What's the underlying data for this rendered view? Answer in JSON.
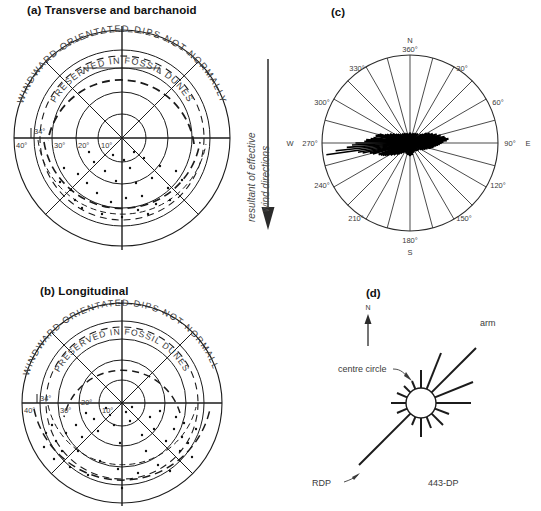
{
  "figure": {
    "panels": [
      {
        "id": "a",
        "title": "(a) Transverse and barchanoid"
      },
      {
        "id": "b",
        "title": "(b) Longitudinal"
      },
      {
        "id": "c",
        "title": "(c)"
      },
      {
        "id": "d",
        "title": "(d)"
      }
    ]
  },
  "dip_plot": {
    "outer_arc_text": "WINDWARD  ORIENTATED   DIPS   NOT   NORMALLY",
    "inner_arc_text": "PRESERVED IN    FOSSIL    DUNES",
    "arc_words_outer": [
      "WINDWARD",
      "ORIENTATED",
      "DIPS",
      "NOT",
      "NORMALLY"
    ],
    "arc_words_inner": [
      "PRESERVED IN",
      "FOSSIL",
      "DUNES"
    ],
    "ring_labels": [
      "40°",
      "30°",
      "20°",
      "10°"
    ],
    "special_label": "34°",
    "ring_values": [
      40,
      30,
      20,
      10
    ],
    "special_value": 34
  },
  "middle_arrow": {
    "line1": "resultant of effective",
    "line2": "wind directions",
    "direction": "down"
  },
  "rose": {
    "cardinals": {
      "north": "N",
      "east": "E",
      "south": "S",
      "west": "W"
    },
    "tick_labels": [
      "360°",
      "30°",
      "60°",
      "90°",
      "120°",
      "150°",
      "180°",
      "210°",
      "240°",
      "270°",
      "300°",
      "330°"
    ],
    "tick_angles": [
      0,
      30,
      60,
      90,
      120,
      150,
      180,
      210,
      240,
      270,
      300,
      330
    ],
    "sector_count": 24
  },
  "sand_rose": {
    "labels": {
      "arm": "arm",
      "centre_circle": "centre circle",
      "rdp": "RDP",
      "dp_value": "443-DP",
      "north": "N"
    }
  },
  "chart_data": [
    {
      "type": "scatter",
      "panel": "a",
      "title": "(a) Transverse and barchanoid",
      "projection": "polar-dip",
      "rlabel": "dip angle (degrees)",
      "rticks": [
        10,
        20,
        30,
        40
      ],
      "rlim": [
        0,
        40
      ],
      "annotations": [
        "WINDWARD  ORIENTATED  DIPS  NOT  NORMALLY",
        "PRESERVED IN  FOSSIL  DUNES",
        "34°"
      ],
      "points_azimuth_dip": [
        [
          168,
          26
        ],
        [
          176,
          24
        ],
        [
          185,
          27
        ],
        [
          150,
          22
        ],
        [
          200,
          23
        ],
        [
          160,
          18
        ],
        [
          190,
          19
        ],
        [
          175,
          16
        ],
        [
          205,
          16
        ],
        [
          145,
          15
        ],
        [
          196,
          12
        ],
        [
          172,
          11
        ],
        [
          183,
          9
        ],
        [
          158,
          8
        ],
        [
          210,
          10
        ],
        [
          215,
          21
        ],
        [
          138,
          23
        ],
        [
          228,
          17
        ],
        [
          131,
          19
        ],
        [
          165,
          30
        ],
        [
          181,
          31
        ],
        [
          199,
          29
        ],
        [
          152,
          28
        ],
        [
          207,
          31
        ],
        [
          188,
          34
        ],
        [
          170,
          33
        ],
        [
          222,
          26
        ],
        [
          142,
          27
        ],
        [
          193,
          6
        ],
        [
          178,
          5
        ],
        [
          163,
          34
        ],
        [
          201,
          34
        ]
      ]
    },
    {
      "type": "scatter",
      "panel": "b",
      "title": "(b) Longitudinal",
      "projection": "polar-dip",
      "rlabel": "dip angle (degrees)",
      "rticks": [
        10,
        20,
        30,
        40
      ],
      "rlim": [
        0,
        40
      ],
      "annotations": [
        "WINDWARD  ORIENTATED  DIPS  NOT  NORMALLY",
        "PRESERVED IN  FOSSIL  DUNES",
        "34°"
      ],
      "points_azimuth_dip": [
        [
          120,
          30
        ],
        [
          128,
          24
        ],
        [
          135,
          19
        ],
        [
          143,
          27
        ],
        [
          150,
          14
        ],
        [
          158,
          22
        ],
        [
          165,
          9
        ],
        [
          172,
          17
        ],
        [
          180,
          25
        ],
        [
          188,
          12
        ],
        [
          196,
          20
        ],
        [
          204,
          7
        ],
        [
          212,
          16
        ],
        [
          220,
          24
        ],
        [
          228,
          13
        ],
        [
          236,
          21
        ],
        [
          244,
          29
        ],
        [
          252,
          18
        ],
        [
          110,
          22
        ],
        [
          103,
          28
        ],
        [
          258,
          26
        ],
        [
          265,
          31
        ],
        [
          115,
          33
        ],
        [
          245,
          34
        ],
        [
          190,
          33
        ],
        [
          175,
          31
        ],
        [
          160,
          29
        ],
        [
          205,
          30
        ],
        [
          140,
          34
        ],
        [
          225,
          33
        ],
        [
          168,
          5
        ],
        [
          198,
          4
        ],
        [
          133,
          11
        ],
        [
          237,
          9
        ],
        [
          148,
          33
        ],
        [
          215,
          28
        ],
        [
          182,
          8
        ],
        [
          192,
          28
        ],
        [
          156,
          25
        ],
        [
          231,
          25
        ]
      ]
    },
    {
      "type": "rose",
      "panel": "c",
      "title": "(c)",
      "units": "degrees azimuth",
      "sector_count": 24,
      "axis_labels": [
        "N 360°",
        "30°",
        "60°",
        "90° E",
        "120°",
        "150°",
        "180° S",
        "210°",
        "240°",
        "W 270°",
        "300°",
        "330°"
      ],
      "spikes_azimuth_length": [
        [
          262,
          0.96
        ],
        [
          266,
          0.72
        ],
        [
          270,
          0.62
        ],
        [
          258,
          0.55
        ],
        [
          274,
          0.5
        ],
        [
          254,
          0.44
        ],
        [
          278,
          0.42
        ],
        [
          250,
          0.38
        ],
        [
          282,
          0.4
        ],
        [
          246,
          0.34
        ],
        [
          286,
          0.36
        ],
        [
          242,
          0.3
        ],
        [
          290,
          0.28
        ],
        [
          238,
          0.26
        ],
        [
          294,
          0.25
        ],
        [
          234,
          0.23
        ],
        [
          298,
          0.22
        ],
        [
          230,
          0.2
        ],
        [
          302,
          0.19
        ],
        [
          226,
          0.18
        ],
        [
          306,
          0.17
        ],
        [
          222,
          0.16
        ],
        [
          310,
          0.15
        ],
        [
          218,
          0.14
        ],
        [
          80,
          0.4
        ],
        [
          84,
          0.44
        ],
        [
          88,
          0.38
        ],
        [
          92,
          0.34
        ],
        [
          76,
          0.36
        ],
        [
          96,
          0.3
        ],
        [
          72,
          0.32
        ],
        [
          100,
          0.27
        ],
        [
          68,
          0.28
        ],
        [
          104,
          0.24
        ],
        [
          64,
          0.25
        ],
        [
          108,
          0.21
        ],
        [
          60,
          0.22
        ],
        [
          112,
          0.19
        ],
        [
          56,
          0.18
        ],
        [
          116,
          0.17
        ],
        [
          52,
          0.16
        ],
        [
          120,
          0.15
        ],
        [
          130,
          0.13
        ],
        [
          140,
          0.12
        ],
        [
          150,
          0.11
        ],
        [
          160,
          0.12
        ],
        [
          170,
          0.14
        ],
        [
          180,
          0.15
        ],
        [
          190,
          0.14
        ],
        [
          200,
          0.13
        ],
        [
          210,
          0.12
        ],
        [
          20,
          0.12
        ],
        [
          30,
          0.13
        ],
        [
          40,
          0.14
        ],
        [
          10,
          0.11
        ],
        [
          0,
          0.12
        ],
        [
          350,
          0.11
        ],
        [
          340,
          0.12
        ],
        [
          330,
          0.13
        ],
        [
          320,
          0.14
        ],
        [
          264,
          0.85
        ],
        [
          268,
          0.66
        ],
        [
          260,
          0.6
        ],
        [
          272,
          0.52
        ],
        [
          256,
          0.47
        ],
        [
          276,
          0.45
        ],
        [
          248,
          0.36
        ],
        [
          284,
          0.38
        ],
        [
          244,
          0.32
        ],
        [
          288,
          0.3
        ],
        [
          86,
          0.42
        ],
        [
          90,
          0.36
        ],
        [
          82,
          0.41
        ],
        [
          94,
          0.32
        ],
        [
          78,
          0.34
        ],
        [
          98,
          0.28
        ],
        [
          74,
          0.3
        ],
        [
          102,
          0.25
        ]
      ]
    },
    {
      "type": "rose",
      "panel": "d",
      "title": "(d)",
      "label": "443-DP",
      "arms_azimuth_length": [
        [
          45,
          1.0
        ],
        [
          68,
          0.62
        ],
        [
          90,
          0.52
        ],
        [
          113,
          0.3
        ],
        [
          130,
          0.26
        ],
        [
          0,
          0.34
        ],
        [
          338,
          0.14
        ],
        [
          315,
          0.16
        ],
        [
          292,
          0.18
        ],
        [
          270,
          0.22
        ],
        [
          248,
          0.2
        ],
        [
          225,
          0.9
        ],
        [
          202,
          0.14
        ],
        [
          180,
          0.3
        ],
        [
          158,
          0.18
        ],
        [
          22,
          0.2
        ]
      ],
      "rdp_azimuth": 225,
      "arm_azimuth": 45
    }
  ]
}
